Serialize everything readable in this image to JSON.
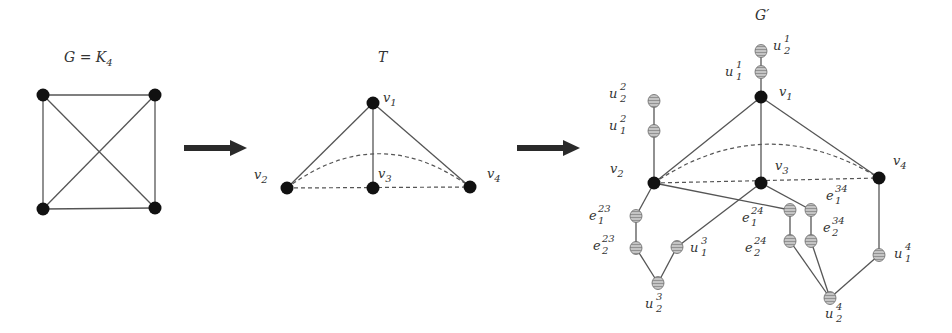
{
  "figure": {
    "panels": [
      {
        "id": "G",
        "title_main": "G = K",
        "title_sub": "4",
        "vertices": [
          {
            "id": "a",
            "x": 43,
            "y": 95
          },
          {
            "id": "b",
            "x": 155,
            "y": 95
          },
          {
            "id": "c",
            "x": 43,
            "y": 209
          },
          {
            "id": "d",
            "x": 155,
            "y": 208
          }
        ],
        "edges": [
          [
            "a",
            "b"
          ],
          [
            "a",
            "c"
          ],
          [
            "b",
            "d"
          ],
          [
            "c",
            "d"
          ],
          [
            "a",
            "d"
          ],
          [
            "b",
            "c"
          ]
        ]
      },
      {
        "id": "T",
        "title_main": "T",
        "vertices": [
          {
            "id": "v1",
            "label": "v",
            "sub": "1",
            "x": 373,
            "y": 103
          },
          {
            "id": "v2",
            "label": "v",
            "sub": "2",
            "x": 287,
            "y": 188
          },
          {
            "id": "v3",
            "label": "v",
            "sub": "3",
            "x": 373,
            "y": 188
          },
          {
            "id": "v4",
            "label": "v",
            "sub": "4",
            "x": 470,
            "y": 187
          }
        ],
        "edges_solid": [
          [
            "v1",
            "v2"
          ],
          [
            "v1",
            "v3"
          ],
          [
            "v1",
            "v4"
          ]
        ],
        "edges_dashed": [
          [
            "v2",
            "v3"
          ],
          [
            "v3",
            "v4"
          ]
        ],
        "arc_dashed": [
          "v2",
          "v4"
        ]
      },
      {
        "id": "G_prime",
        "title_main": "G",
        "title_prime": "′",
        "black_vertices": [
          {
            "id": "v1",
            "label": "v",
            "sub": "1",
            "x": 761,
            "y": 97
          },
          {
            "id": "v2",
            "label": "v",
            "sub": "2",
            "x": 654,
            "y": 183
          },
          {
            "id": "v3",
            "label": "v",
            "sub": "3",
            "x": 761,
            "y": 183
          },
          {
            "id": "v4",
            "label": "v",
            "sub": "4",
            "x": 879,
            "y": 178
          }
        ],
        "gray_vertices": [
          {
            "id": "u11",
            "label": "u",
            "sup": "1",
            "sub": "1",
            "x": 761,
            "y": 72
          },
          {
            "id": "u21",
            "label": "u",
            "sup": "1",
            "sub": "2",
            "x": 761,
            "y": 51
          },
          {
            "id": "u12",
            "label": "u",
            "sup": "2",
            "sub": "1",
            "x": 654,
            "y": 131
          },
          {
            "id": "u22",
            "label": "u",
            "sup": "2",
            "sub": "2",
            "x": 654,
            "y": 101
          },
          {
            "id": "e123",
            "label": "e",
            "sup": "23",
            "sub": "1",
            "x": 636,
            "y": 216
          },
          {
            "id": "e223",
            "label": "e",
            "sup": "23",
            "sub": "2",
            "x": 636,
            "y": 248
          },
          {
            "id": "u13",
            "label": "u",
            "sup": "3",
            "sub": "1",
            "x": 677,
            "y": 247
          },
          {
            "id": "u23",
            "label": "u",
            "sup": "3",
            "sub": "2",
            "x": 658,
            "y": 283
          },
          {
            "id": "e124",
            "label": "e",
            "sup": "24",
            "sub": "1",
            "x": 790,
            "y": 210
          },
          {
            "id": "e224",
            "label": "e",
            "sup": "24",
            "sub": "2",
            "x": 790,
            "y": 241
          },
          {
            "id": "e134",
            "label": "e",
            "sup": "34",
            "sub": "1",
            "x": 811,
            "y": 210
          },
          {
            "id": "e234",
            "label": "e",
            "sup": "34",
            "sub": "2",
            "x": 811,
            "y": 241
          },
          {
            "id": "u14",
            "label": "u",
            "sup": "4",
            "sub": "1",
            "x": 879,
            "y": 255
          },
          {
            "id": "u24",
            "label": "u",
            "sup": "4",
            "sub": "2",
            "x": 830,
            "y": 298
          }
        ]
      }
    ],
    "arrows": [
      {
        "from_x": 184,
        "to_x": 246,
        "y": 148
      },
      {
        "from_x": 517,
        "to_x": 579,
        "y": 148
      }
    ],
    "colors": {
      "vertex_black": "#111111",
      "vertex_gray": "#b5b5b5",
      "edge": "#555555",
      "text": "#333333"
    }
  }
}
